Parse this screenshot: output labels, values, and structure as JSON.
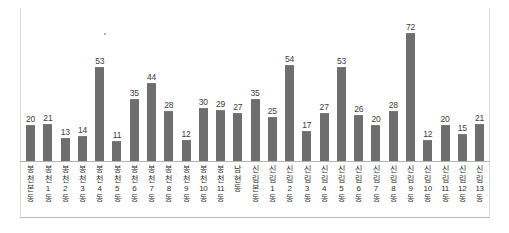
{
  "chart_data": {
    "type": "bar",
    "title": "",
    "subtitle": "",
    "xlabel": "",
    "ylabel": "",
    "ylim": [
      0,
      80
    ],
    "grid": false,
    "legend": false,
    "bar_color": "#6e6e6e",
    "axis_color": "#b4b4b4",
    "frame_color": "#d9d9d9",
    "value_label_color": "#3d3d3d",
    "categories": [
      "봉천본동",
      "봉천1동",
      "봉천2동",
      "봉천3동",
      "봉천4동",
      "봉천5동",
      "봉천6동",
      "봉천7동",
      "봉천8동",
      "봉천9동",
      "봉천10동",
      "봉천11동",
      "남현동",
      "신림본동",
      "신림1동",
      "신림2동",
      "신림3동",
      "신림4동",
      "신림5동",
      "신림6동",
      "신림7동",
      "신림8동",
      "신림9동",
      "신림10동",
      "신림11동",
      "신림12동",
      "신림13동"
    ],
    "category_lines": [
      [
        "봉",
        "천",
        "본",
        "동"
      ],
      [
        "봉",
        "천",
        "1",
        "동"
      ],
      [
        "봉",
        "천",
        "2",
        "동"
      ],
      [
        "봉",
        "천",
        "3",
        "동"
      ],
      [
        "봉",
        "천",
        "4",
        "동"
      ],
      [
        "봉",
        "천",
        "5",
        "동"
      ],
      [
        "봉",
        "천",
        "6",
        "동"
      ],
      [
        "봉",
        "천",
        "7",
        "동"
      ],
      [
        "봉",
        "천",
        "8",
        "동"
      ],
      [
        "봉",
        "천",
        "9",
        "동"
      ],
      [
        "봉",
        "천",
        "10",
        "동"
      ],
      [
        "봉",
        "천",
        "11",
        "동"
      ],
      [
        "남",
        "현",
        "동"
      ],
      [
        "신",
        "림",
        "본",
        "동"
      ],
      [
        "신",
        "림",
        "1",
        "동"
      ],
      [
        "신",
        "림",
        "2",
        "동"
      ],
      [
        "신",
        "림",
        "3",
        "동"
      ],
      [
        "신",
        "림",
        "4",
        "동"
      ],
      [
        "신",
        "림",
        "5",
        "동"
      ],
      [
        "신",
        "림",
        "6",
        "동"
      ],
      [
        "신",
        "림",
        "7",
        "동"
      ],
      [
        "신",
        "림",
        "8",
        "동"
      ],
      [
        "신",
        "림",
        "9",
        "동"
      ],
      [
        "신",
        "림",
        "10",
        "동"
      ],
      [
        "신",
        "림",
        "11",
        "동"
      ],
      [
        "신",
        "림",
        "12",
        "동"
      ],
      [
        "신",
        "림",
        "13",
        "동"
      ]
    ],
    "values": [
      20,
      21,
      13,
      14,
      53,
      11,
      35,
      44,
      28,
      12,
      30,
      29,
      27,
      35,
      25,
      54,
      17,
      27,
      53,
      26,
      20,
      28,
      72,
      12,
      20,
      15,
      21
    ],
    "value_labels": [
      "20",
      "21",
      "13",
      "14",
      "53",
      "11",
      "35",
      "44",
      "28",
      "12",
      "30",
      "29",
      "27",
      "35",
      "25",
      "54",
      "17",
      "27",
      "53",
      "26",
      "20",
      "28",
      "72",
      "12",
      "20",
      "15",
      "21"
    ]
  }
}
